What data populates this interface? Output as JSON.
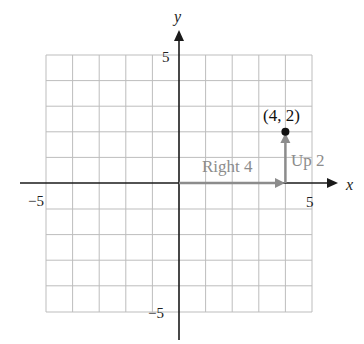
{
  "diagram": {
    "axes": {
      "x_label": "x",
      "y_label": "y",
      "range": [
        -5,
        5
      ]
    },
    "tick_labels": {
      "x_pos": "5",
      "x_neg": "−5",
      "y_pos": "5",
      "y_neg": "−5"
    },
    "point": {
      "label": "(4, 2)",
      "x": 4,
      "y": 2
    },
    "moves": {
      "horizontal": "Right 4",
      "vertical": "Up 2"
    },
    "colors": {
      "grid": "#bdbdbd",
      "axis": "#1a1a1a",
      "arrow": "#8c8c8c",
      "point": "#111111"
    }
  }
}
